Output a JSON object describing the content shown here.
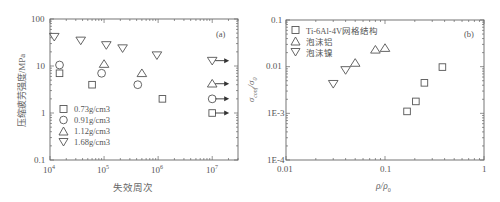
{
  "chart_data": [
    {
      "id": "a",
      "type": "scatter",
      "panel_label": "(a)",
      "title": "",
      "xlabel": "失效周次",
      "ylabel": "压缩疲劳强度/MPa",
      "xscale": "log",
      "yscale": "log",
      "xlim": [
        10000,
        30000000
      ],
      "ylim": [
        0.1,
        100
      ],
      "xticks": [
        "10^4",
        "10^5",
        "10^6",
        "10^7"
      ],
      "yticks": [
        "0.1",
        "1",
        "10",
        "100"
      ],
      "grid": false,
      "legend_position": "lower left",
      "series": [
        {
          "name": "0.73g/cm3",
          "marker": "square",
          "points": [
            [
              15000,
              7
            ],
            [
              60000,
              4
            ],
            [
              1200000,
              2
            ]
          ],
          "runout": [
            [
              10000000,
              1
            ]
          ]
        },
        {
          "name": "0.91g/cm3",
          "marker": "circle",
          "points": [
            [
              15000,
              10.5
            ],
            [
              90000,
              7
            ],
            [
              420000,
              4
            ]
          ],
          "runout": [
            [
              10000000,
              2
            ]
          ]
        },
        {
          "name": "1.12g/cm3",
          "marker": "triangle-up",
          "points": [
            [
              100000,
              11
            ],
            [
              500000,
              7
            ]
          ],
          "runout": [
            [
              10000000,
              4.2
            ]
          ]
        },
        {
          "name": "1.68g/cm3",
          "marker": "triangle-down",
          "points": [
            [
              12000,
              42
            ],
            [
              37000,
              35
            ],
            [
              110000,
              28
            ],
            [
              220000,
              24
            ],
            [
              950000,
              17
            ]
          ],
          "runout": [
            [
              10000000,
              13
            ]
          ]
        }
      ],
      "annotations": [
        "runout arrows at 10^7 cycles"
      ]
    },
    {
      "id": "b",
      "type": "scatter",
      "panel_label": "(b)",
      "title": "",
      "xlabel": "ρ/ρ0",
      "ylabel": "σconf/σ0",
      "xscale": "log",
      "yscale": "log",
      "xlim": [
        0.01,
        1
      ],
      "ylim": [
        0.0001,
        0.1
      ],
      "xticks": [
        "0.01",
        "0.1",
        "1"
      ],
      "yticks": [
        "1E-4",
        "1E-3",
        "0.01",
        "0.1"
      ],
      "grid": false,
      "legend_position": "upper left",
      "series": [
        {
          "name": "Ti-6Al-4V网格结构",
          "marker": "square",
          "points": [
            [
              0.167,
              0.0011
            ],
            [
              0.205,
              0.0018
            ],
            [
              0.25,
              0.0045
            ],
            [
              0.38,
              0.0098
            ]
          ]
        },
        {
          "name": "泡沫铝",
          "marker": "triangle-up",
          "points": [
            [
              0.05,
              0.012
            ],
            [
              0.08,
              0.023
            ],
            [
              0.1,
              0.025
            ]
          ]
        },
        {
          "name": "泡沫镍",
          "marker": "triangle-down",
          "points": [
            [
              0.03,
              0.0043
            ],
            [
              0.04,
              0.0085
            ]
          ]
        }
      ]
    }
  ],
  "colors": {
    "axis": "#666666",
    "marker": "#555555",
    "text": "#555555"
  }
}
